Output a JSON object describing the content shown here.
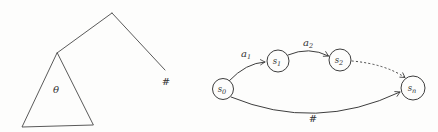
{
  "colors": {
    "ink": "#3e3e3e",
    "background": "#fdfdfc"
  },
  "tree": {
    "theta_label": "θ",
    "leaf_label": "#"
  },
  "automaton": {
    "states": [
      {
        "id": "s0",
        "base": "s",
        "sub": "0"
      },
      {
        "id": "s1",
        "base": "s",
        "sub": "1"
      },
      {
        "id": "s2",
        "base": "s",
        "sub": "2"
      },
      {
        "id": "sn",
        "base": "s",
        "sub": "n"
      }
    ],
    "edges": [
      {
        "from": "s0",
        "to": "s1",
        "label_base": "a",
        "label_sub": "1",
        "style": "solid"
      },
      {
        "from": "s1",
        "to": "s2",
        "label_base": "a",
        "label_sub": "2",
        "style": "solid"
      },
      {
        "from": "s2",
        "to": "sn",
        "label_base": "",
        "label_sub": "",
        "style": "dotted"
      },
      {
        "from": "s0",
        "to": "sn",
        "label_base": "#",
        "label_sub": "",
        "style": "solid"
      }
    ]
  }
}
